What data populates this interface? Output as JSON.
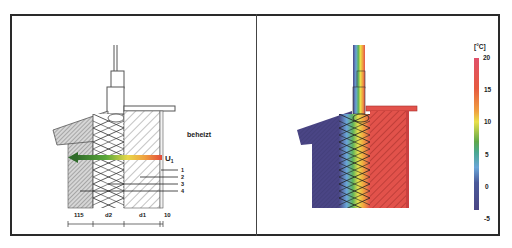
{
  "figure": {
    "left_panel": {
      "room_label": "beheizt",
      "heat_flow_label": "U",
      "heat_flow_subscript": "1",
      "layer_callouts": [
        "1",
        "2",
        "3",
        "4"
      ],
      "dimensions": [
        "115",
        "d2",
        "d1",
        "10"
      ]
    },
    "right_panel": {
      "legend": {
        "unit": "[°C]",
        "ticks": [
          "20",
          "15",
          "10",
          "5",
          "0",
          "-5"
        ],
        "min": -5,
        "max": 20
      },
      "colors": {
        "cold": "#4a4585",
        "warm": "#e0504a",
        "frame_cold": "#3d3a7a"
      }
    }
  }
}
